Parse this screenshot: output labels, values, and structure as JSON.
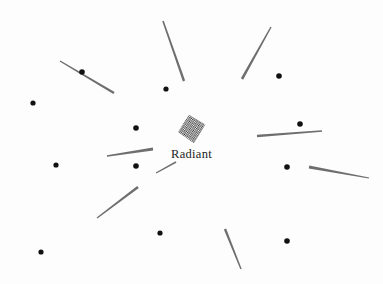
{
  "canvas": {
    "width": 383,
    "height": 284,
    "background_color": "#fdfdfd"
  },
  "brand": {
    "wordmark": "Radiant",
    "mark_name": "halftone-diamond-logo",
    "mark_color": "#2b2b2b",
    "wordmark_color": "#1c1c1c"
  },
  "graphic": {
    "ray_color": "#6e6e6e",
    "dot_color": "#111111",
    "rays": [
      {
        "name": "ray-top-center",
        "x1": 163,
        "y1": 21,
        "x2": 184,
        "y2": 81,
        "w1": 1.6,
        "w2": 2.4
      },
      {
        "name": "ray-upper-right",
        "x1": 271,
        "y1": 27,
        "x2": 242,
        "y2": 79,
        "w1": 1.4,
        "w2": 2.6
      },
      {
        "name": "ray-upper-left",
        "x1": 60,
        "y1": 61,
        "x2": 114,
        "y2": 93,
        "w1": 1.4,
        "w2": 2.6
      },
      {
        "name": "ray-right-upper",
        "x1": 322,
        "y1": 131,
        "x2": 257,
        "y2": 136,
        "w1": 1.3,
        "w2": 2.6
      },
      {
        "name": "ray-left-inner",
        "x1": 107,
        "y1": 156,
        "x2": 153,
        "y2": 149,
        "w1": 1.3,
        "w2": 2.8
      },
      {
        "name": "ray-left-short",
        "x1": 156,
        "y1": 173,
        "x2": 176,
        "y2": 162,
        "w1": 1.2,
        "w2": 1.8
      },
      {
        "name": "ray-right-lower",
        "x1": 369,
        "y1": 178,
        "x2": 309,
        "y2": 167,
        "w1": 1.2,
        "w2": 3.0
      },
      {
        "name": "ray-lower-left",
        "x1": 97,
        "y1": 218,
        "x2": 138,
        "y2": 187,
        "w1": 1.3,
        "w2": 2.8
      },
      {
        "name": "ray-lower-right",
        "x1": 241,
        "y1": 269,
        "x2": 225,
        "y2": 229,
        "w1": 1.4,
        "w2": 2.4
      }
    ],
    "dots": [
      {
        "name": "dot-upper-left-far",
        "cx": 33,
        "cy": 103,
        "r": 2.6
      },
      {
        "name": "dot-on-upper-ray",
        "cx": 82,
        "cy": 72,
        "r": 2.8
      },
      {
        "name": "dot-left-mid",
        "cx": 56,
        "cy": 165,
        "r": 2.6
      },
      {
        "name": "dot-lower-left",
        "cx": 41,
        "cy": 252,
        "r": 2.6
      },
      {
        "name": "dot-top-center",
        "cx": 166,
        "cy": 89,
        "r": 2.6
      },
      {
        "name": "dot-center-left",
        "cx": 136,
        "cy": 128,
        "r": 2.8
      },
      {
        "name": "dot-below-left-ray",
        "cx": 136,
        "cy": 166,
        "r": 2.8
      },
      {
        "name": "dot-bottom-center",
        "cx": 160,
        "cy": 233,
        "r": 2.6
      },
      {
        "name": "dot-upper-right",
        "cx": 279,
        "cy": 76,
        "r": 2.8
      },
      {
        "name": "dot-right-of-mark",
        "cx": 300,
        "cy": 124,
        "r": 2.8
      },
      {
        "name": "dot-right-mid",
        "cx": 287,
        "cy": 167,
        "r": 2.8
      },
      {
        "name": "dot-right-lower",
        "cx": 287,
        "cy": 241,
        "r": 2.8
      }
    ]
  }
}
